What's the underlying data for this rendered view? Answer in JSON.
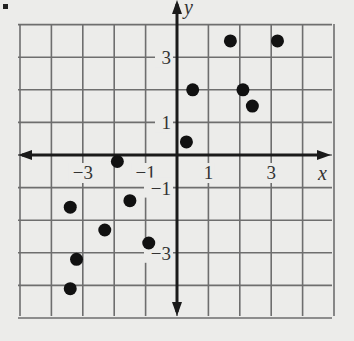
{
  "chart_data": {
    "type": "scatter",
    "title": "",
    "xlabel": "x",
    "ylabel": "y",
    "xlim": [
      -5,
      5
    ],
    "ylim": [
      -5,
      4.5
    ],
    "grid": true,
    "x_tick_labels": [
      "-3",
      "-1",
      "1",
      "3"
    ],
    "y_tick_labels": [
      "3",
      "1",
      "-1",
      "-3"
    ],
    "x_ticks": [
      -3,
      -1,
      1,
      3
    ],
    "y_ticks": [
      3,
      1,
      -1,
      -3
    ],
    "points": [
      {
        "x": 1.7,
        "y": 3.5
      },
      {
        "x": 3.2,
        "y": 3.5
      },
      {
        "x": 0.5,
        "y": 2.0
      },
      {
        "x": 2.1,
        "y": 2.0
      },
      {
        "x": 2.4,
        "y": 1.5
      },
      {
        "x": 0.3,
        "y": 0.4
      },
      {
        "x": -1.9,
        "y": -0.2
      },
      {
        "x": -3.4,
        "y": -1.6
      },
      {
        "x": -1.5,
        "y": -1.4
      },
      {
        "x": -2.3,
        "y": -2.3
      },
      {
        "x": -0.9,
        "y": -2.7
      },
      {
        "x": -3.2,
        "y": -3.2
      },
      {
        "x": -3.4,
        "y": -4.1
      }
    ],
    "colors": {
      "background": "#ececea",
      "grid": "#6e6e6e",
      "axis": "#1a1a1a",
      "point": "#111111"
    }
  }
}
